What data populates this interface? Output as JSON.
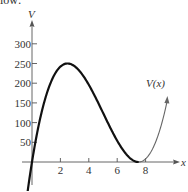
{
  "caption_fragment": "low:",
  "chart_data": {
    "type": "line",
    "title": "",
    "xlabel": "x",
    "ylabel": "V",
    "curve_label": "V(x)",
    "function": "V(x) = x(15 - 2x)^2",
    "x_ticks": [
      2,
      4,
      6,
      8
    ],
    "x_tick_labels": [
      "2",
      "4",
      "6",
      "8"
    ],
    "y_ticks": [
      50,
      100,
      150,
      200,
      250,
      300
    ],
    "y_tick_labels": [
      "50",
      "100",
      "150",
      "200",
      "250",
      "300"
    ],
    "xlim": [
      -0.3,
      10
    ],
    "ylim": [
      -60,
      340
    ],
    "grid": false,
    "legend": "none",
    "annotations": [
      {
        "text": "V(x)",
        "x": 8.7,
        "y": 185
      }
    ],
    "series": [
      {
        "name": "V(x)",
        "x": [
          -0.3,
          0,
          0.5,
          1,
          1.5,
          2,
          2.5,
          3,
          3.5,
          4,
          4.5,
          5,
          5.5,
          6,
          6.5,
          7,
          7.5,
          8,
          8.5,
          9,
          9.5
        ],
        "values": [
          -77.5,
          0,
          98,
          169,
          216,
          242,
          250,
          243,
          224,
          196,
          162,
          125,
          88,
          54,
          26,
          7,
          0,
          8,
          34,
          81,
          152
        ],
        "emphasized_range": [
          0,
          7.5
        ],
        "faded_range": [
          7.5,
          9.5
        ]
      }
    ],
    "key_points": {
      "local_max": {
        "x": 2.5,
        "y": 250
      },
      "local_min": {
        "x": 7.5,
        "y": 0
      }
    }
  }
}
